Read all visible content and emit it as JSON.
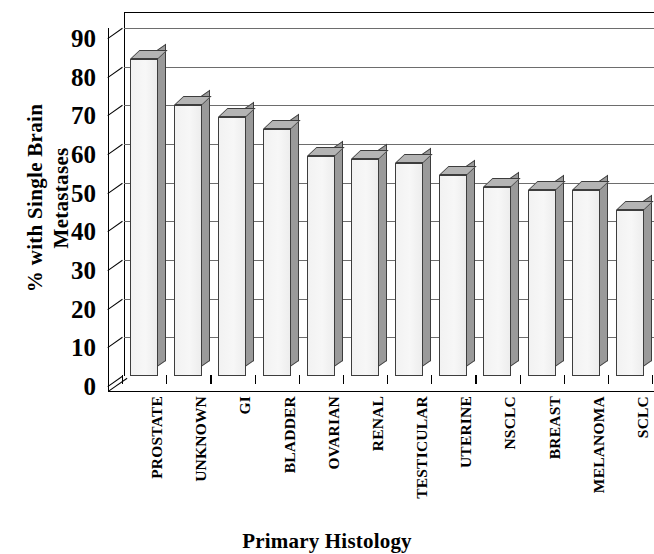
{
  "chart_data": {
    "type": "bar",
    "title": "",
    "xlabel": "Primary Histology",
    "ylabel": "% with Single Brain Metastases",
    "ylabel_lines": [
      "% with Single Brain",
      "Metastases"
    ],
    "categories": [
      "PROSTATE",
      "UNKNOWN",
      "GI",
      "BLADDER",
      "OVARIAN",
      "RENAL",
      "TESTICULAR",
      "UTERINE",
      "NSCLC",
      "BREAST",
      "MELANOMA",
      "SCLC"
    ],
    "values": [
      82,
      70,
      67,
      64,
      57,
      56,
      55,
      52,
      49,
      48,
      48,
      43
    ],
    "top_values": [
      85,
      73,
      70,
      67,
      60,
      59,
      58,
      55,
      52,
      51,
      51,
      46
    ],
    "ylim": [
      0,
      90
    ],
    "yticks": [
      0,
      10,
      20,
      30,
      40,
      50,
      60,
      70,
      80,
      90
    ],
    "ytick_labels": [
      "0",
      "10",
      "20",
      "30",
      "40",
      "50",
      "60",
      "70",
      "80",
      "90"
    ],
    "grid": true,
    "legend": null,
    "style": "3d-column",
    "bar_face_color": "#f2f2f2",
    "bar_top_color": "#b4b4b4",
    "bar_side_color": "#9a9a9a",
    "bar_edge_color": "#3d3d3d",
    "grid_color": "#6d6d6d",
    "axis_color": "#000000",
    "background": "#ffffff"
  }
}
